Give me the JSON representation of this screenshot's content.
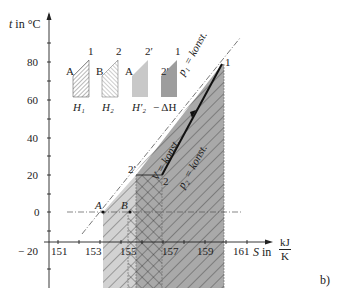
{
  "figure": {
    "panel_label": "b)",
    "y_axis": {
      "symbol": "t",
      "unit_text": "in °C",
      "ticks": [
        "80",
        "60",
        "40",
        "20",
        "0",
        "− 20"
      ]
    },
    "x_axis": {
      "symbol": "S",
      "unit_prefix": "in",
      "unit_num": "kJ",
      "unit_den": "K",
      "ticks": [
        "151",
        "153",
        "155",
        "157",
        "159",
        "161"
      ]
    },
    "points": {
      "A": "A",
      "B": "B",
      "two_prime": "2′",
      "two": "2",
      "one": "1"
    },
    "line_labels": {
      "p1": "p₁ = konst.",
      "v": "V = konst.",
      "p2": "p₂ = konst."
    },
    "legend": [
      {
        "id": "H1",
        "label": "H₁",
        "from": "A",
        "to": "1",
        "style": "hatch-dense"
      },
      {
        "id": "H2",
        "label": "H₂",
        "from": "B",
        "to": "2",
        "style": "hatch-light"
      },
      {
        "id": "H2prime",
        "label": "H′₂",
        "from": "A",
        "to": "2′",
        "style": "light-gray"
      },
      {
        "id": "dH",
        "label": "− ΔH",
        "from": "2′",
        "to": "1",
        "style": "dark-gray"
      }
    ],
    "colors": {
      "light_gray": "#cfcfcf",
      "mid_gray": "#b5b5b5",
      "dark_gray": "#9a9a9a",
      "ink": "#222222"
    }
  }
}
